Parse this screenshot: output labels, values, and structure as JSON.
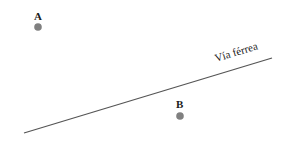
{
  "diagram": {
    "points": [
      {
        "label": "A",
        "x": 38,
        "y": 27,
        "color": "#808080"
      },
      {
        "label": "B",
        "x": 180,
        "y": 116,
        "color": "#808080"
      }
    ],
    "railway": {
      "label": "Vía férrea",
      "x1": 24,
      "y1": 133,
      "x2": 272,
      "y2": 58,
      "color": "#555555"
    }
  }
}
